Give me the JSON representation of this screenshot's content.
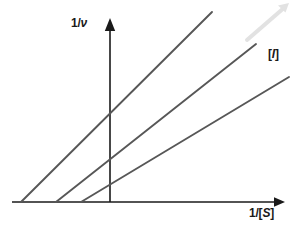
{
  "figure": {
    "background_color": "#ffffff",
    "width": 306,
    "height": 230
  },
  "labels": {
    "y_axis_prefix": "1/",
    "y_axis_symbol": "ν",
    "x_axis_prefix": "1/[",
    "x_axis_symbol": "S",
    "x_axis_suffix": "]",
    "inhibitor_prefix": "[",
    "inhibitor_symbol": "I",
    "inhibitor_suffix": "]"
  },
  "colors": {
    "line_color": "#575757",
    "axis_color": "#1a1a1a",
    "text_color": "#1a1a1a",
    "inhibitor_arrow_color": "#e2e2e2"
  },
  "chart_data": {
    "type": "line",
    "xlabel": "1/[S]",
    "ylabel": "1/ν",
    "grid": false,
    "legend": "none",
    "annotations": [
      {
        "name": "inhibitor-concentration",
        "text": "[I]",
        "meaning": "increasing inhibitor concentration",
        "arrow": {
          "x1": 247,
          "y1": 40,
          "x2": 288,
          "y2": 4
        }
      }
    ],
    "axes": {
      "origin": {
        "x": 110,
        "y": 202
      },
      "y_axis": {
        "x": 110,
        "y_top": 20,
        "y_bottom": 202,
        "arrow": "up"
      },
      "x_axis": {
        "y": 202,
        "x_left": 12,
        "x_right": 284,
        "arrow": "right"
      }
    },
    "common_intercept": {
      "x": 110,
      "y": 158
    },
    "series": [
      {
        "name": "highest-inhibitor",
        "x_intercept_px": 21,
        "points_px": [
          [
            21,
            202
          ],
          [
            212,
            12
          ]
        ],
        "description": "steepest slope, largest apparent Km"
      },
      {
        "name": "medium-inhibitor",
        "x_intercept_px": 56,
        "points_px": [
          [
            56,
            202
          ],
          [
            256,
            44
          ]
        ],
        "description": "intermediate slope"
      },
      {
        "name": "no-inhibitor",
        "x_intercept_px": 81,
        "points_px": [
          [
            81,
            202
          ],
          [
            289,
            77
          ]
        ],
        "description": "shallowest slope, smallest apparent Km"
      }
    ]
  }
}
